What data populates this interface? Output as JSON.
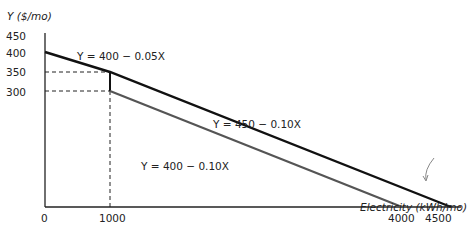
{
  "chart_data": {
    "type": "line",
    "title": "",
    "xlabel": "Electricity (kWh/mo)",
    "ylabel": "Y ($/mo)",
    "xlim": [
      0,
      4500
    ],
    "ylim": [
      0,
      450
    ],
    "x_ticks": [
      "0",
      "1000",
      "4000",
      "4500"
    ],
    "y_ticks": [
      "300",
      "350",
      "400",
      "450"
    ],
    "grid": false,
    "series": [
      {
        "name": "Y = 400 - 0.05X",
        "segment": "kinked budget (first block)",
        "points": [
          [
            0,
            400
          ],
          [
            1000,
            350
          ]
        ],
        "color": "#111111"
      },
      {
        "name": "Y = 450 - 0.10X",
        "segment": "kinked budget (second block)",
        "points": [
          [
            1000,
            350
          ],
          [
            4500,
            0
          ]
        ],
        "color": "#111111"
      },
      {
        "name": "Y = 400 - 0.10X",
        "points": [
          [
            1000,
            300
          ],
          [
            4000,
            0
          ]
        ],
        "color": "#555555"
      }
    ],
    "reference_lines": [
      {
        "type": "horizontal-dashed",
        "y": 350,
        "x_to": 1000
      },
      {
        "type": "horizontal-dashed",
        "y": 300,
        "x_to": 1000
      },
      {
        "type": "vertical-dashed",
        "x": 1000,
        "y_to": 350
      }
    ],
    "annotations": [
      {
        "text": "Y = 400 − 0.05X"
      },
      {
        "text": "Y = 450 − 0.10X"
      },
      {
        "text": "Y = 400 − 0.10X"
      },
      {
        "type": "arrow",
        "pointing_to": "x-intercept 4500 of Y = 450 − 0.10X"
      }
    ]
  },
  "labels": {
    "y_axis": "Y ($/mo)",
    "x_axis": "Electricity (kWh/mo)",
    "y450": "450",
    "y400": "400",
    "y350": "350",
    "y300": "300",
    "x0": "0",
    "x1000": "1000",
    "x4000": "4000",
    "x4500": "4500",
    "eq1": "Y = 400 − 0.05X",
    "eq2": "Y = 450 − 0.10X",
    "eq3": "Y = 400 − 0.10X"
  }
}
